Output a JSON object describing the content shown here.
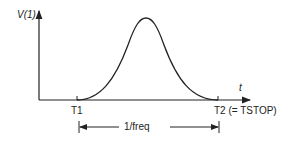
{
  "diagram": {
    "title": "",
    "y_axis_label": "V(1)",
    "x_axis_label": "t",
    "markers": [
      {
        "label": "T1"
      },
      {
        "label": "T2 (= TSTOP)"
      }
    ],
    "dimension_label": "1/freq",
    "curve": "bell-shaped pulse from T1 to T2",
    "colors": {
      "line": "#222222",
      "background": "#ffffff"
    }
  }
}
